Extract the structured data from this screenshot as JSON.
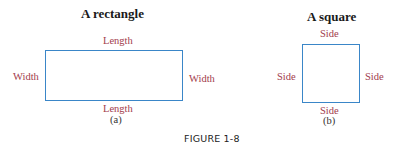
{
  "figure_caption": "FIGURE 1-8",
  "panels": [
    {
      "title": "A rectangle",
      "shape": "rectangle",
      "labels": {
        "top": "Length",
        "bottom": "Length",
        "left": "Width",
        "right": "Width"
      },
      "sub_label": "(a)"
    },
    {
      "title": "A square",
      "shape": "square",
      "labels": {
        "top": "Side",
        "bottom": "Side",
        "left": "Side",
        "right": "Side"
      },
      "sub_label": "(b)"
    }
  ],
  "colors": {
    "outline": "#3a86c8",
    "label": "#a23c4c",
    "title": "#1a1a1a"
  }
}
